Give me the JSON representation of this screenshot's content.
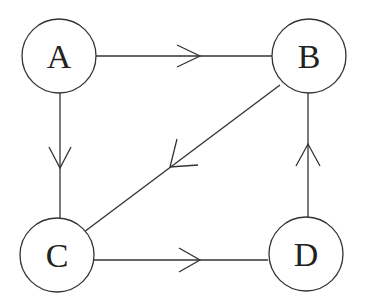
{
  "diagram": {
    "type": "directed-graph",
    "colors": {
      "stroke": "#333333",
      "text": "#222222",
      "background": "#ffffff"
    },
    "nodes": [
      {
        "id": "A",
        "label": "A",
        "cx": 59,
        "cy": 56,
        "r": 37
      },
      {
        "id": "B",
        "label": "B",
        "cx": 309,
        "cy": 56,
        "r": 37
      },
      {
        "id": "C",
        "label": "C",
        "cx": 57,
        "cy": 255,
        "r": 37
      },
      {
        "id": "D",
        "label": "D",
        "cx": 306,
        "cy": 254,
        "r": 37
      }
    ],
    "edges": [
      {
        "from": "A",
        "to": "B"
      },
      {
        "from": "A",
        "to": "C"
      },
      {
        "from": "B",
        "to": "C"
      },
      {
        "from": "C",
        "to": "D"
      },
      {
        "from": "D",
        "to": "B"
      }
    ]
  }
}
